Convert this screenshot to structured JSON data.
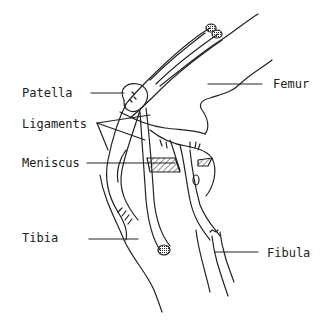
{
  "diagram": {
    "stroke_color": "#222222",
    "background": "#ffffff",
    "labels": [
      {
        "id": "patella",
        "text": "Patella"
      },
      {
        "id": "ligaments",
        "text": "Ligaments"
      },
      {
        "id": "meniscus",
        "text": "Meniscus"
      },
      {
        "id": "tibia",
        "text": "Tibia"
      },
      {
        "id": "femur",
        "text": "Femur"
      },
      {
        "id": "fibula",
        "text": "Fibula"
      }
    ]
  }
}
